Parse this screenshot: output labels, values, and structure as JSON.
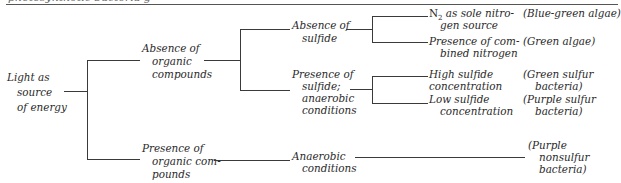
{
  "header": {
    "fragment": "photosynthetic bacteria g"
  },
  "root": {
    "lines": [
      "Light as",
      "source",
      "of energy"
    ]
  },
  "level1": {
    "absence_organic": [
      "Absence of",
      "organic",
      "compounds"
    ],
    "presence_organic": [
      "Presence of",
      "organic com-",
      "pounds"
    ]
  },
  "level2": {
    "absence_sulfide": [
      "Absence of",
      "sulfide"
    ],
    "presence_sulfide": [
      "Presence of",
      "sulfide;",
      "anaerobic",
      "conditions"
    ],
    "anaerobic": [
      "Anaerobic",
      "conditions"
    ]
  },
  "level3": {
    "n2_prefix": "N",
    "n2_sub": "2",
    "n2_line1_rest": " as sole nitro-",
    "n2_line2": "gen source",
    "combined": [
      "Presence of com-",
      "bined nitrogen"
    ],
    "high_sulfide": [
      "High sulfide",
      "concentration"
    ],
    "low_sulfide": [
      "Low sulfide",
      "concentration"
    ]
  },
  "organisms": {
    "blue_green": "(Blue-green algae)",
    "green_algae": "(Green algae)",
    "green_sulfur": [
      "(Green sulfur",
      "bacteria)"
    ],
    "purple_sulfur": [
      "(Purple sulfur",
      "bacteria)"
    ],
    "purple_nonsulfur": [
      "(Purple",
      "nonsulfur",
      "bacteria)"
    ]
  }
}
